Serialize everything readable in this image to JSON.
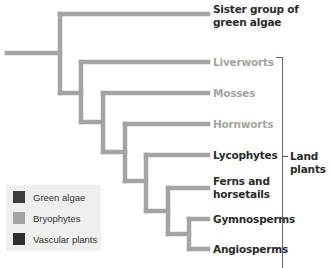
{
  "diagram": {
    "type": "cladogram",
    "branch_color": "#a4a4a4",
    "taxa": [
      {
        "label": "Sister group of green algae",
        "line1": "Sister group of",
        "line2": "green algae",
        "group": "Green algae"
      },
      {
        "label": "Liverworts",
        "group": "Bryophytes"
      },
      {
        "label": "Mosses",
        "group": "Bryophytes"
      },
      {
        "label": "Hornworts",
        "group": "Bryophytes"
      },
      {
        "label": "Lycophytes",
        "group": "Vascular plants"
      },
      {
        "label": "Ferns and horsetails",
        "line1": "Ferns and",
        "line2": "horsetails",
        "group": "Vascular plants"
      },
      {
        "label": "Gymnosperms",
        "group": "Vascular plants"
      },
      {
        "label": "Angiosperms",
        "group": "Vascular plants"
      }
    ],
    "bracket": {
      "line1": "Land",
      "line2": "plants",
      "label": "Land plants"
    }
  },
  "legend": {
    "items": [
      {
        "label": "Green algae",
        "color": "#3d3d3d"
      },
      {
        "label": "Bryophytes",
        "color": "#a3a3a3"
      },
      {
        "label": "Vascular plants",
        "color": "#2f2f2f"
      }
    ]
  }
}
